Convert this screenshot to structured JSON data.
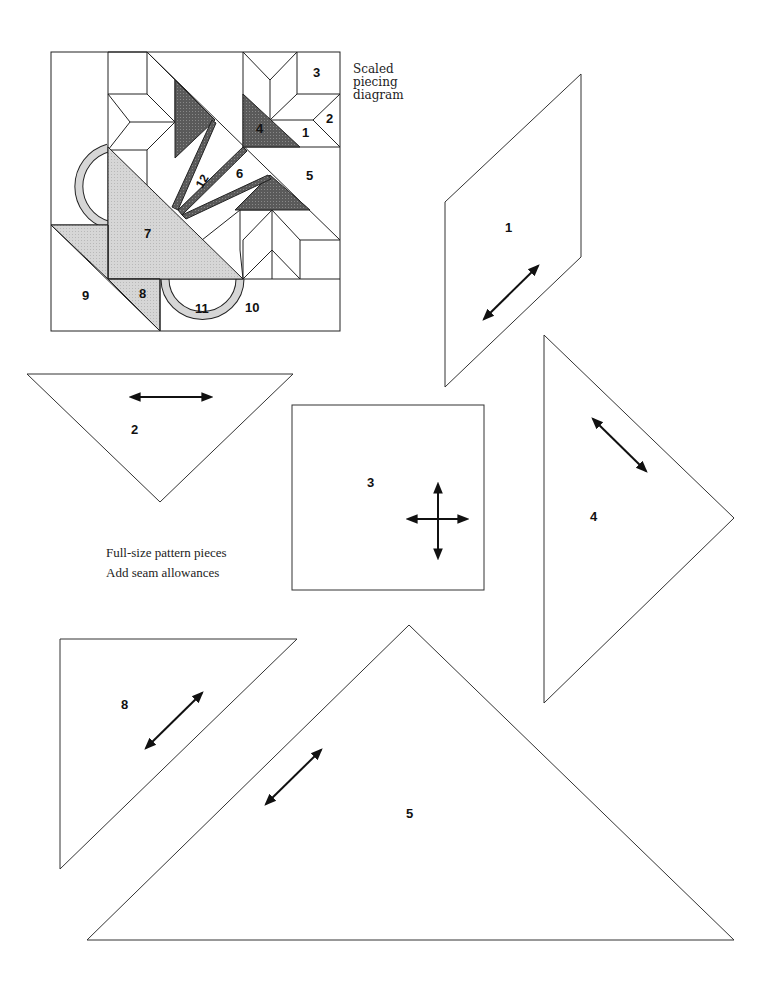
{
  "diagram": {
    "caption_lines": [
      "Scaled",
      "piecing",
      "diagram"
    ],
    "notes": [
      "Full-size pattern pieces",
      "Add seam allowances"
    ],
    "block_labels": {
      "p1": "1",
      "p2": "2",
      "p3": "3",
      "p4": "4",
      "p5": "5",
      "p6": "6",
      "p7": "7",
      "p8": "8",
      "p9": "9",
      "p10": "10",
      "p11": "11",
      "p12": "12"
    },
    "pieces": [
      {
        "id": "1",
        "shape": "parallelogram",
        "grainline": "diagonal"
      },
      {
        "id": "2",
        "shape": "triangle",
        "grainline": "horizontal"
      },
      {
        "id": "3",
        "shape": "square",
        "grainline": "cross"
      },
      {
        "id": "4",
        "shape": "triangle",
        "grainline": "diagonal"
      },
      {
        "id": "5",
        "shape": "triangle",
        "grainline": "diagonal"
      },
      {
        "id": "8",
        "shape": "triangle",
        "grainline": "diagonal"
      }
    ],
    "colors": {
      "line": "#222222",
      "dark_fill": "#555555",
      "light_fill": "#d4d4d4",
      "background": "#ffffff"
    }
  }
}
